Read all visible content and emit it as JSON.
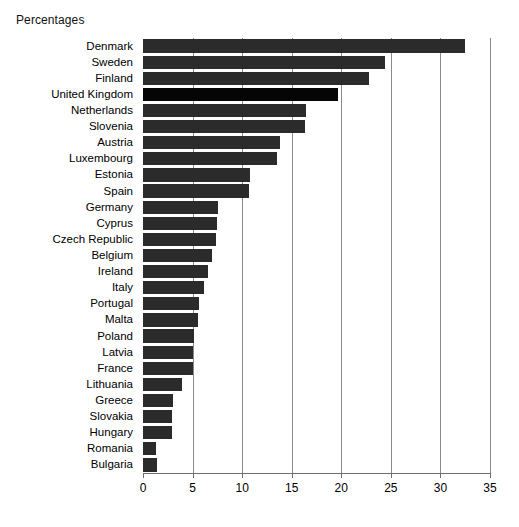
{
  "chart_data": {
    "type": "bar",
    "orientation": "horizontal",
    "title": "Percentages",
    "xlabel": "",
    "ylabel": "",
    "xlim": [
      0,
      35
    ],
    "xticks": [
      0,
      5,
      10,
      15,
      20,
      25,
      30,
      35
    ],
    "xtick_labels": [
      "0",
      "5",
      "10",
      "15",
      "20",
      "25",
      "30",
      "35"
    ],
    "grid": "vertical",
    "legend": "none",
    "bar_color": "#2b2b2b",
    "highlight_color": "#050505",
    "highlight_category": "United Kingdom",
    "categories": [
      "Denmark",
      "Sweden",
      "Finland",
      "United Kingdom",
      "Netherlands",
      "Slovenia",
      "Austria",
      "Luxembourg",
      "Estonia",
      "Spain",
      "Germany",
      "Cyprus",
      "Czech Republic",
      "Belgium",
      "Ireland",
      "Italy",
      "Portugal",
      "Malta",
      "Poland",
      "Latvia",
      "France",
      "Lithuania",
      "Greece",
      "Slovakia",
      "Hungary",
      "Romania",
      "Bulgaria"
    ],
    "values": [
      32.5,
      24.4,
      22.8,
      19.7,
      16.4,
      16.3,
      13.8,
      13.5,
      10.8,
      10.7,
      7.6,
      7.5,
      7.4,
      7.0,
      6.6,
      6.2,
      5.6,
      5.5,
      5.1,
      5.0,
      5.0,
      3.9,
      3.0,
      2.9,
      2.9,
      1.3,
      1.4
    ]
  }
}
